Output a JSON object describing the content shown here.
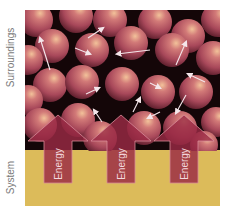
{
  "labels": {
    "surroundings": "Surroundings",
    "system": "System"
  },
  "arrows": [
    {
      "label": "Energy",
      "cx": 58
    },
    {
      "label": "Energy",
      "cx": 121
    },
    {
      "label": "Energy",
      "cx": 184
    }
  ],
  "colors": {
    "background_dark": "#140608",
    "sphere_base": "#a8485a",
    "sphere_highlight": "#f0b890",
    "system_gold": "#dcbb5a",
    "arrow_fill": "#9a2a44",
    "motion_arrow": "#f4e6ea",
    "label_gray": "#7a7a7a"
  }
}
